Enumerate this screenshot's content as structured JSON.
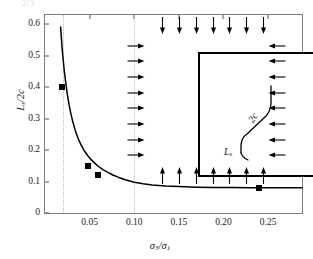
{
  "figure": {
    "top_artifact": "2/3",
    "background": "#ffffff",
    "frame_color": "#7d7d7d",
    "curve_color": "#000000",
    "marker_color": "#000000",
    "guide_color": "#b9b9b9"
  },
  "axes": {
    "y": {
      "label": "L",
      "label_sub": "s",
      "label_tail": "/2c",
      "ticks": [
        "0",
        "0.1",
        "0.2",
        "0.3",
        "0.4",
        "0.5",
        "0.6"
      ],
      "values": [
        0,
        0.1,
        0.2,
        0.3,
        0.4,
        0.5,
        0.6
      ],
      "min": 0,
      "max": 0.63
    },
    "x": {
      "label_a": "σ",
      "label_a_sub": "3",
      "label_slash": "/",
      "label_b": "σ",
      "label_b_sub": "1",
      "ticks": [
        "0.05",
        "0.10",
        "0.15",
        "0.20",
        "0.25"
      ],
      "values": [
        0.05,
        0.1,
        0.15,
        0.2,
        0.25
      ],
      "min": 0.0,
      "max": 0.288
    }
  },
  "guides": {
    "lines": [
      0.02,
      0.1
    ]
  },
  "inset": {
    "name": "loading-diagram",
    "arrows_top": 7,
    "arrows_bottom": 7,
    "arrows_left": 8,
    "arrows_right": 8,
    "crack_label_2c": "2c",
    "crack_label_ls": "L",
    "crack_label_ls_sub": "s"
  },
  "chart_data": {
    "type": "line",
    "title": "",
    "xlabel": "σ₃/σ₁",
    "ylabel": "Lₛ/2c",
    "xlim": [
      0.0,
      0.288
    ],
    "ylim": [
      0.0,
      0.63
    ],
    "grid": false,
    "legend": "none",
    "series": [
      {
        "name": "wing crack length curve",
        "style": "solid",
        "x": [
          0.0175,
          0.018,
          0.019,
          0.02,
          0.0215,
          0.023,
          0.025,
          0.027,
          0.029,
          0.031,
          0.034,
          0.037,
          0.04,
          0.044,
          0.048,
          0.052,
          0.056,
          0.06,
          0.065,
          0.07,
          0.076,
          0.082,
          0.09,
          0.1,
          0.11,
          0.12,
          0.135,
          0.15,
          0.17,
          0.19,
          0.21,
          0.23,
          0.25,
          0.27,
          0.288
        ],
        "y": [
          0.592,
          0.57,
          0.53,
          0.498,
          0.455,
          0.42,
          0.378,
          0.344,
          0.316,
          0.292,
          0.262,
          0.238,
          0.219,
          0.198,
          0.182,
          0.169,
          0.158,
          0.148,
          0.138,
          0.13,
          0.121,
          0.114,
          0.106,
          0.098,
          0.093,
          0.089,
          0.086,
          0.084,
          0.082,
          0.081,
          0.081,
          0.08,
          0.08,
          0.08,
          0.08
        ]
      }
    ],
    "points": [
      {
        "x": 0.0195,
        "y": 0.402
      },
      {
        "x": 0.048,
        "y": 0.151
      },
      {
        "x": 0.059,
        "y": 0.121
      },
      {
        "x": 0.24,
        "y": 0.08
      }
    ],
    "vertical_guides": [
      0.02,
      0.1
    ],
    "annotations": []
  }
}
